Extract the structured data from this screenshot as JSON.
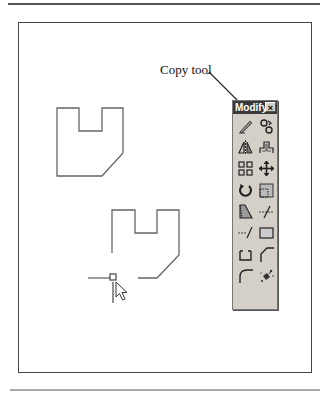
{
  "figure": {
    "callout_label": "Copy tool"
  },
  "toolbar": {
    "title": "Modify",
    "close_label": "×",
    "tools": [
      {
        "name": "erase",
        "icon": "eraser-icon"
      },
      {
        "name": "copy",
        "icon": "copy-icon"
      },
      {
        "name": "mirror",
        "icon": "mirror-icon"
      },
      {
        "name": "offset",
        "icon": "offset-icon"
      },
      {
        "name": "array",
        "icon": "array-icon"
      },
      {
        "name": "move",
        "icon": "move-icon"
      },
      {
        "name": "rotate",
        "icon": "rotate-icon"
      },
      {
        "name": "scale",
        "icon": "scale-icon"
      },
      {
        "name": "stretch",
        "icon": "stretch-icon"
      },
      {
        "name": "trim",
        "icon": "trim-icon"
      },
      {
        "name": "extend",
        "icon": "extend-icon"
      },
      {
        "name": "break",
        "icon": "break-icon"
      },
      {
        "name": "join",
        "icon": "join-icon"
      },
      {
        "name": "chamfer",
        "icon": "chamfer-icon"
      },
      {
        "name": "fillet",
        "icon": "fillet-icon"
      },
      {
        "name": "explode",
        "icon": "explode-icon"
      }
    ]
  },
  "colors": {
    "toolbar_bg": "#d4d0c8",
    "title_bar": "#3a3a3a",
    "line": "#555555"
  }
}
